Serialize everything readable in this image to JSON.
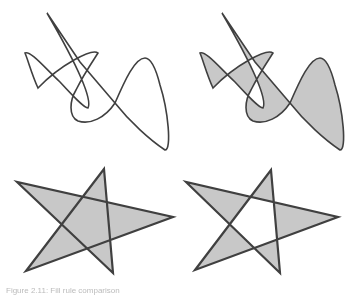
{
  "colors": {
    "stroke": "#404040",
    "fill": "#c8c8c8",
    "background": "#ffffff"
  },
  "figures": [
    {
      "name": "curve-outline",
      "fill": "none",
      "fill_rule": "nonzero",
      "d": "M47,13 L80,62 L115,103 C130,122 150,140 165,150 C172,150 168,110 160,85 C155,65 150,58 145,58 C135,58 125,80 115,103 C105,118 90,125 78,121 C68,116 70,100 76,90 C85,72 95,58 98,53 C92,48 60,65 38,88 C32,75 28,60 25,53 C30,50 45,68 60,82 C72,95 84,108 88,108 C92,100 80,70 47,13 Z"
    },
    {
      "name": "curve-evenodd-fill",
      "fill": "#c8c8c8",
      "fill_rule": "evenodd",
      "d": "M222,13 L255,62 L290,103 C305,122 325,140 340,150 C347,150 343,110 335,85 C330,65 325,58 320,58 C310,58 300,80 290,103 C280,118 265,125 253,121 C243,116 245,100 251,90 C260,72 270,58 273,53 C267,48 235,65 213,88 C207,75 203,60 200,53 C205,50 220,68 235,82 C247,95 259,108 263,108 C267,100 255,70 222,13 Z"
    },
    {
      "name": "star-nonzero-fill",
      "fill": "#c8c8c8",
      "fill_rule": "nonzero",
      "d": "M104,169 L113,273 L17,182 L173,217 L26,271 Z"
    },
    {
      "name": "star-evenodd-fill",
      "fill": "#c8c8c8",
      "fill_rule": "evenodd",
      "d": "M271,170 L280,273 L186,182 L338,217 L195,270 Z"
    }
  ],
  "caption": "Figure 2.11: Fill rule comparison"
}
